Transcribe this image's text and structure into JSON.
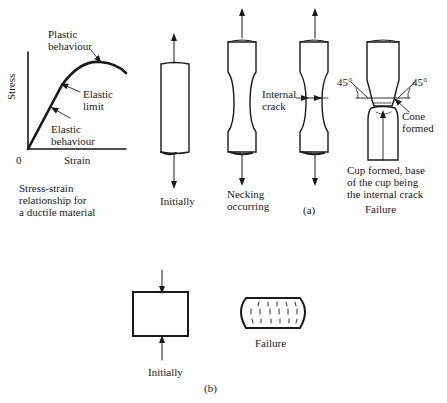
{
  "graph": {
    "origin_label": "0",
    "y_axis_label": "Stress",
    "x_axis_label": "Strain",
    "annotations": {
      "plastic": [
        "Plastic",
        "behaviour"
      ],
      "elastic_limit": [
        "Elastic",
        "limit"
      ],
      "elastic": [
        "Elastic",
        "behaviour"
      ]
    },
    "caption": [
      "Stress-strain",
      "relationship for",
      "a ductile material"
    ]
  },
  "tension": {
    "stage_initial": "Initially",
    "stage_necking": [
      "Necking",
      "occurring"
    ],
    "internal_crack": [
      "Internal",
      "crack"
    ],
    "angle_left": "45°",
    "angle_right": "45°",
    "cone": [
      "Cone",
      "formed"
    ],
    "cup": [
      "Cup formed, base",
      "of the cup being",
      "the internal crack"
    ],
    "stage_failure": "Failure",
    "part_label": "(a)"
  },
  "compression": {
    "stage_initial": "Initially",
    "stage_failure": "Failure",
    "part_label": "(b)"
  },
  "colors": {
    "ink": "#1a1a1a",
    "background": "#ffffff"
  }
}
